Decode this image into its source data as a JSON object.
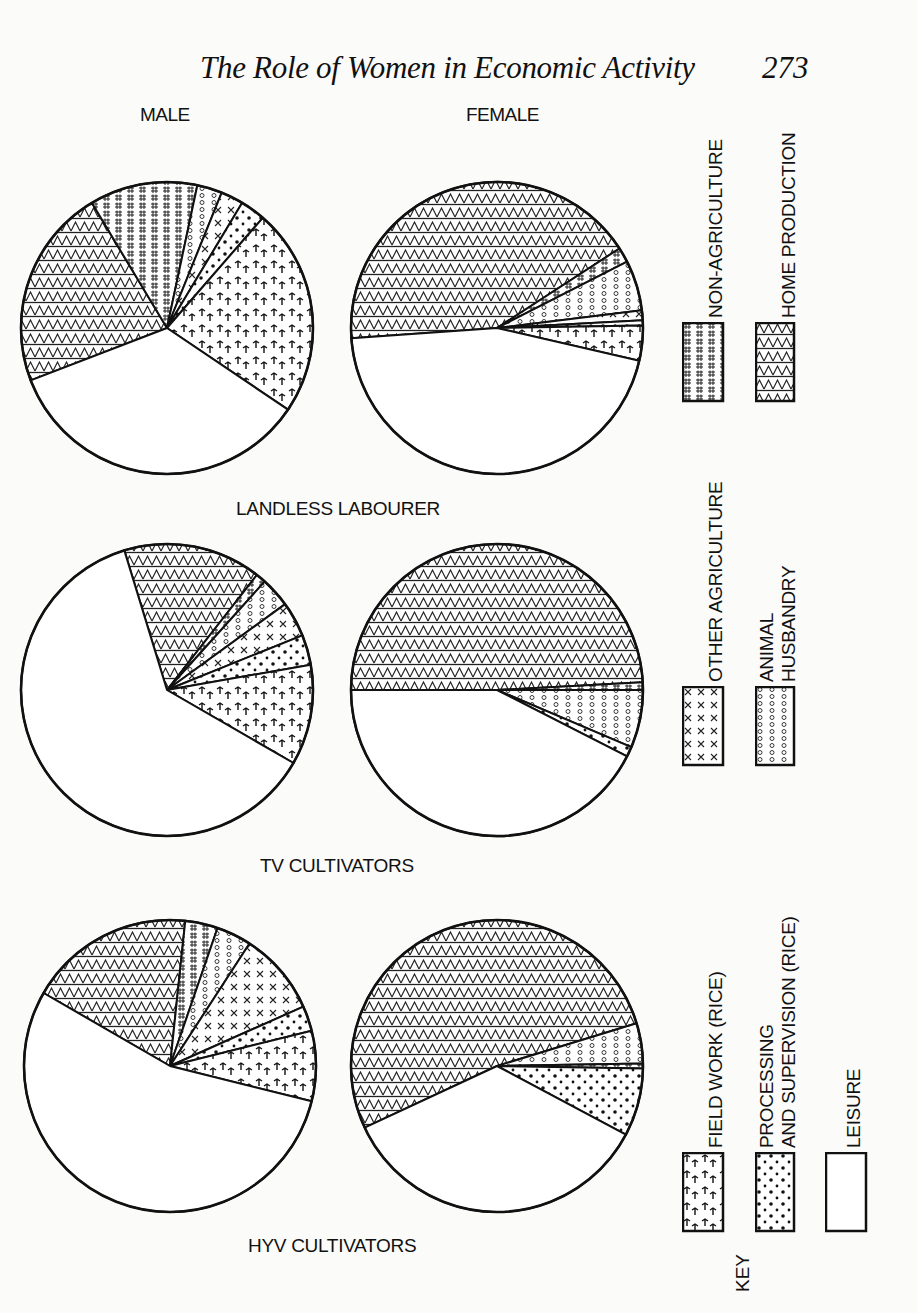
{
  "header": {
    "running_title": "The Role of Women in Economic Activity",
    "page_number": "273"
  },
  "columns": {
    "male": "MALE",
    "female": "FEMALE"
  },
  "groups": {
    "landless": "LANDLESS LABOURER",
    "tv": "TV CULTIVATORS",
    "hyv": "HYV CULTIVATORS"
  },
  "legend": {
    "title": "KEY",
    "items": [
      {
        "id": "non_agriculture",
        "label": "NON-AGRICULTURE",
        "pattern": "hash"
      },
      {
        "id": "home_production",
        "label": "HOME PRODUCTION",
        "pattern": "triangles"
      },
      {
        "id": "other_agriculture",
        "label": "OTHER  AGRICULTURE",
        "pattern": "crosses"
      },
      {
        "id": "animal_husbandry",
        "label_line1": "ANIMAL",
        "label_line2": "HUSBANDRY",
        "label": "ANIMAL HUSBANDRY",
        "pattern": "circles"
      },
      {
        "id": "field_work",
        "label": "FIELD WORK  (RICE)",
        "pattern": "palms"
      },
      {
        "id": "processing",
        "label_line1": "PROCESSING",
        "label_line2": "AND SUPERVISION  (RICE)",
        "label": "PROCESSING AND SUPERVISION (RICE)",
        "pattern": "dots"
      },
      {
        "id": "leisure",
        "label": "LEISURE",
        "pattern": "blank"
      }
    ]
  },
  "chart_data": {
    "type": "pie",
    "legend_position": "right (rotated)",
    "categories": [
      "Home production",
      "Non-agriculture",
      "Animal husbandry",
      "Other agriculture",
      "Processing and supervision (rice)",
      "Field work (rice)",
      "Leisure"
    ],
    "charts": [
      {
        "group": "LANDLESS LABOURER",
        "sex": "MALE",
        "values": [
          22,
          12,
          3,
          2.5,
          3,
          23,
          34.5
        ]
      },
      {
        "group": "LANDLESS LABOURER",
        "sex": "FEMALE",
        "values": [
          42,
          2,
          5.5,
          1,
          0.5,
          3,
          46
        ]
      },
      {
        "group": "TV CULTIVATORS",
        "sex": "MALE",
        "values": [
          15,
          1,
          3.5,
          3.5,
          3.5,
          8.5,
          65
        ]
      },
      {
        "group": "TV CULTIVATORS",
        "sex": "FEMALE",
        "values": [
          49,
          1,
          6.5,
          0,
          1,
          0,
          42.5
        ]
      },
      {
        "group": "HYV CULTIVATORS",
        "sex": "MALE",
        "values": [
          18,
          3.5,
          4,
          9,
          2.5,
          5,
          58
        ]
      },
      {
        "group": "HYV CULTIVATORS",
        "sex": "FEMALE",
        "values": [
          52,
          0.3,
          4.5,
          0,
          7.5,
          0,
          35.7
        ]
      }
    ],
    "units": "percent of time (estimated from slice angles)"
  },
  "pies": [
    {
      "id": "landless-male",
      "cx": 167,
      "cy": 328,
      "r": 146,
      "slices": [
        {
          "cat": "home_production",
          "start": 201,
          "end": 121
        },
        {
          "cat": "non_agriculture",
          "start": 121,
          "end": 78
        },
        {
          "cat": "animal_husbandry",
          "start": 78,
          "end": 68
        },
        {
          "cat": "other_agriculture",
          "start": 68,
          "end": 59
        },
        {
          "cat": "processing",
          "start": 59,
          "end": 49
        },
        {
          "cat": "field_work",
          "start": 49,
          "end": -34
        },
        {
          "cat": "leisure",
          "start": -34,
          "end": -159
        }
      ]
    },
    {
      "id": "landless-female",
      "cx": 497,
      "cy": 328,
      "r": 146,
      "slices": [
        {
          "cat": "home_production",
          "start": 184,
          "end": 33
        },
        {
          "cat": "non_agriculture",
          "start": 33,
          "end": 27
        },
        {
          "cat": "animal_husbandry",
          "start": 27,
          "end": 7
        },
        {
          "cat": "other_agriculture",
          "start": 7,
          "end": 3
        },
        {
          "cat": "processing",
          "start": 3,
          "end": 1
        },
        {
          "cat": "field_work",
          "start": 1,
          "end": -13
        },
        {
          "cat": "leisure",
          "start": -13,
          "end": -176
        }
      ]
    },
    {
      "id": "tv-male",
      "cx": 167,
      "cy": 690,
      "r": 146,
      "slices": [
        {
          "cat": "home_production",
          "start": 107,
          "end": 52
        },
        {
          "cat": "non_agriculture",
          "start": 52,
          "end": 48
        },
        {
          "cat": "animal_husbandry",
          "start": 48,
          "end": 36
        },
        {
          "cat": "other_agriculture",
          "start": 36,
          "end": 22
        },
        {
          "cat": "processing",
          "start": 22,
          "end": 10
        },
        {
          "cat": "field_work",
          "start": 10,
          "end": -30
        },
        {
          "cat": "leisure",
          "start": -30,
          "end": -253
        }
      ]
    },
    {
      "id": "tv-female",
      "cx": 497,
      "cy": 690,
      "r": 146,
      "slices": [
        {
          "cat": "home_production",
          "start": 180,
          "end": 3
        },
        {
          "cat": "non_agriculture",
          "start": 3,
          "end": 0
        },
        {
          "cat": "animal_husbandry",
          "start": 0,
          "end": -23
        },
        {
          "cat": "processing",
          "start": -23,
          "end": -27
        },
        {
          "cat": "leisure",
          "start": -27,
          "end": -180
        }
      ]
    },
    {
      "id": "hyv-male",
      "cx": 170,
      "cy": 1066,
      "r": 146,
      "slices": [
        {
          "cat": "home_production",
          "start": 150,
          "end": 84
        },
        {
          "cat": "non_agriculture",
          "start": 84,
          "end": 71
        },
        {
          "cat": "animal_husbandry",
          "start": 71,
          "end": 57
        },
        {
          "cat": "other_agriculture",
          "start": 57,
          "end": 24
        },
        {
          "cat": "processing",
          "start": 24,
          "end": 14
        },
        {
          "cat": "field_work",
          "start": 14,
          "end": -14
        },
        {
          "cat": "leisure",
          "start": -14,
          "end": -210
        }
      ]
    },
    {
      "id": "hyv-female",
      "cx": 497,
      "cy": 1066,
      "r": 146,
      "slices": [
        {
          "cat": "home_production",
          "start": 205,
          "end": 17
        },
        {
          "cat": "animal_husbandry",
          "start": 17,
          "end": 1
        },
        {
          "cat": "non_agriculture",
          "start": 1,
          "end": -1
        },
        {
          "cat": "processing",
          "start": -1,
          "end": -28
        },
        {
          "cat": "leisure",
          "start": -28,
          "end": -155
        }
      ]
    }
  ]
}
